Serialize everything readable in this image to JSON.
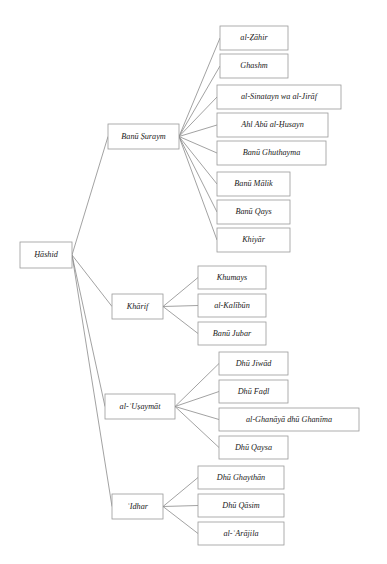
{
  "diagram": {
    "type": "tree",
    "orientation": "left-to-right",
    "colors": {
      "background": "#ffffff",
      "box_border": "#9a9a9a",
      "edge": "#8a8a8a",
      "text": "#1a1a1a"
    },
    "root": {
      "id": "hashid",
      "label": "Ḥāshid",
      "x": 20,
      "y": 242,
      "w": 52,
      "h": 26
    },
    "branches": [
      {
        "id": "banu-suraym",
        "label": "Banū Ṣuraym",
        "x": 108,
        "y": 124,
        "w": 71,
        "h": 25,
        "children": [
          {
            "id": "al-zahir",
            "label": "al-Ẓāhir",
            "x": 220,
            "y": 26,
            "w": 68,
            "h": 24
          },
          {
            "id": "ghashm",
            "label": "Ghashm",
            "x": 220,
            "y": 54,
            "w": 68,
            "h": 24
          },
          {
            "id": "al-sinatayn-wa-al-jiraf",
            "label": "al-Sinatayn wa al-Jirāf",
            "x": 217,
            "y": 85,
            "w": 124,
            "h": 24
          },
          {
            "id": "ahl-abu-al-husayn",
            "label": "Ahl Abū al-Ḥusayn",
            "x": 217,
            "y": 113,
            "w": 111,
            "h": 24
          },
          {
            "id": "banu-ghuthayma",
            "label": "Banū Ghuthayma",
            "x": 217,
            "y": 141,
            "w": 109,
            "h": 24
          },
          {
            "id": "banu-malik",
            "label": "Banū Mālik",
            "x": 217,
            "y": 172,
            "w": 73,
            "h": 24
          },
          {
            "id": "banu-qays",
            "label": "Banū Qays",
            "x": 217,
            "y": 200,
            "w": 73,
            "h": 24
          },
          {
            "id": "khiyar",
            "label": "Khiyār",
            "x": 217,
            "y": 228,
            "w": 73,
            "h": 24
          }
        ]
      },
      {
        "id": "kharif",
        "label": "Khārif",
        "x": 112,
        "y": 294,
        "w": 51,
        "h": 25,
        "children": [
          {
            "id": "khumays",
            "label": "Khumays",
            "x": 198,
            "y": 266,
            "w": 68,
            "h": 23
          },
          {
            "id": "al-kalibun",
            "label": "al-Kalībūn",
            "x": 198,
            "y": 294,
            "w": 68,
            "h": 23
          },
          {
            "id": "banu-jubar",
            "label": "Banū Jubar",
            "x": 198,
            "y": 322,
            "w": 68,
            "h": 23
          }
        ]
      },
      {
        "id": "al-usaymat",
        "label": "al-ʿUṣaymāt",
        "x": 105,
        "y": 394,
        "w": 70,
        "h": 25,
        "children": [
          {
            "id": "dhu-jiwad",
            "label": "Dhū Jiwād",
            "x": 219,
            "y": 352,
            "w": 69,
            "h": 23
          },
          {
            "id": "dhu-fadl",
            "label": "Dhū Faḍl",
            "x": 219,
            "y": 380,
            "w": 69,
            "h": 23
          },
          {
            "id": "al-ghanaya-dhu-ghanima",
            "label": "al-Ghanāyā dhū Ghanīma",
            "x": 219,
            "y": 408,
            "w": 140,
            "h": 23
          },
          {
            "id": "dhu-qaysa",
            "label": "Dhū Qaysa",
            "x": 219,
            "y": 436,
            "w": 69,
            "h": 23
          }
        ]
      },
      {
        "id": "idhar",
        "label": "ʿIdhar",
        "x": 112,
        "y": 494,
        "w": 51,
        "h": 25,
        "children": [
          {
            "id": "dhu-ghaythan",
            "label": "Dhū Ghaythān",
            "x": 198,
            "y": 466,
            "w": 86,
            "h": 23
          },
          {
            "id": "dhu-qasim",
            "label": "Dhū Qāsim",
            "x": 198,
            "y": 494,
            "w": 86,
            "h": 23
          },
          {
            "id": "al-arajila",
            "label": "al-ʿArājila",
            "x": 198,
            "y": 522,
            "w": 86,
            "h": 23
          }
        ]
      }
    ]
  }
}
